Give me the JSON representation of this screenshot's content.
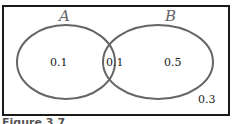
{
  "diagram": {
    "type": "venn",
    "sets": [
      {
        "name": "A",
        "label": "A"
      },
      {
        "name": "B",
        "label": "B"
      }
    ],
    "regions": {
      "a_only": "0.1",
      "a_and_b": "0.1",
      "b_only": "0.5",
      "outside": "0.3"
    },
    "caption": "Figure 3.7"
  },
  "colors": {
    "border": "#1a1a1a",
    "circle_stroke": "#666666",
    "text": "#222222",
    "set_label": "#666666"
  }
}
